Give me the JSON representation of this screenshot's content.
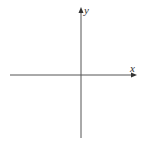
{
  "diagram": {
    "type": "cartesian-axes",
    "x_axis": {
      "label": "x"
    },
    "y_axis": {
      "label": "y"
    },
    "colors": {
      "axis": "#555555",
      "background": "#ffffff"
    }
  }
}
